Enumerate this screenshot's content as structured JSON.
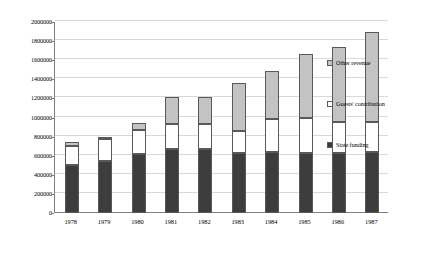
{
  "chart_data": {
    "type": "bar",
    "stacked": true,
    "title": "",
    "subtitle": "",
    "xlabel": "",
    "ylabel": "",
    "categories": [
      "1978",
      "1979",
      "1980",
      "1981",
      "1982",
      "1983",
      "1984",
      "1985",
      "1986",
      "1987"
    ],
    "series": [
      {
        "name": "State funding",
        "color": "#3d3d3d",
        "values": [
          500000,
          545000,
          620000,
          670000,
          670000,
          630000,
          640000,
          630000,
          630000,
          640000
        ]
      },
      {
        "name": "Guests' contribution",
        "color": "#ffffff",
        "values": [
          200000,
          230000,
          250000,
          265000,
          265000,
          230000,
          340000,
          370000,
          320000,
          310000
        ]
      },
      {
        "name": "Other revenue",
        "color": "#c3c3c3",
        "values": [
          40000,
          25000,
          70000,
          275000,
          275000,
          500000,
          510000,
          660000,
          790000,
          950000
        ]
      }
    ],
    "totals": [
      740000,
      800000,
      940000,
      1210000,
      1210000,
      1360000,
      1490000,
      1660000,
      1740000,
      1900000
    ],
    "ylim": [
      0,
      2000000
    ],
    "ytick_values": [
      0,
      200000,
      400000,
      600000,
      800000,
      1000000,
      1200000,
      1400000,
      1600000,
      1800000,
      2000000
    ],
    "ytick_labels": [
      "0",
      "200000",
      "400000",
      "600000",
      "800000",
      "1000000",
      "1200000",
      "1400000",
      "1600000",
      "1800000",
      "2000000"
    ],
    "grid": true,
    "grid_axis": "y",
    "legend_position": "right",
    "legend_entries": [
      {
        "label": "Other revenue",
        "color": "#c3c3c3"
      },
      {
        "label": "Guests' contribution",
        "color": "#ffffff"
      },
      {
        "label": "State funding",
        "color": "#3d3d3d"
      }
    ]
  },
  "axes": {
    "y_ticks": [
      "2000000",
      "1800000",
      "1600000",
      "1400000",
      "1200000",
      "1000000",
      "800000",
      "600000",
      "400000",
      "200000",
      "0"
    ],
    "x_ticks": [
      "1978",
      "1979",
      "1980",
      "1981",
      "1982",
      "1983",
      "1984",
      "1985",
      "1986",
      "1987"
    ]
  },
  "legend": {
    "items": [
      {
        "label": "Other revenue"
      },
      {
        "label": "Guests' contribution"
      },
      {
        "label": "State funding"
      }
    ]
  }
}
